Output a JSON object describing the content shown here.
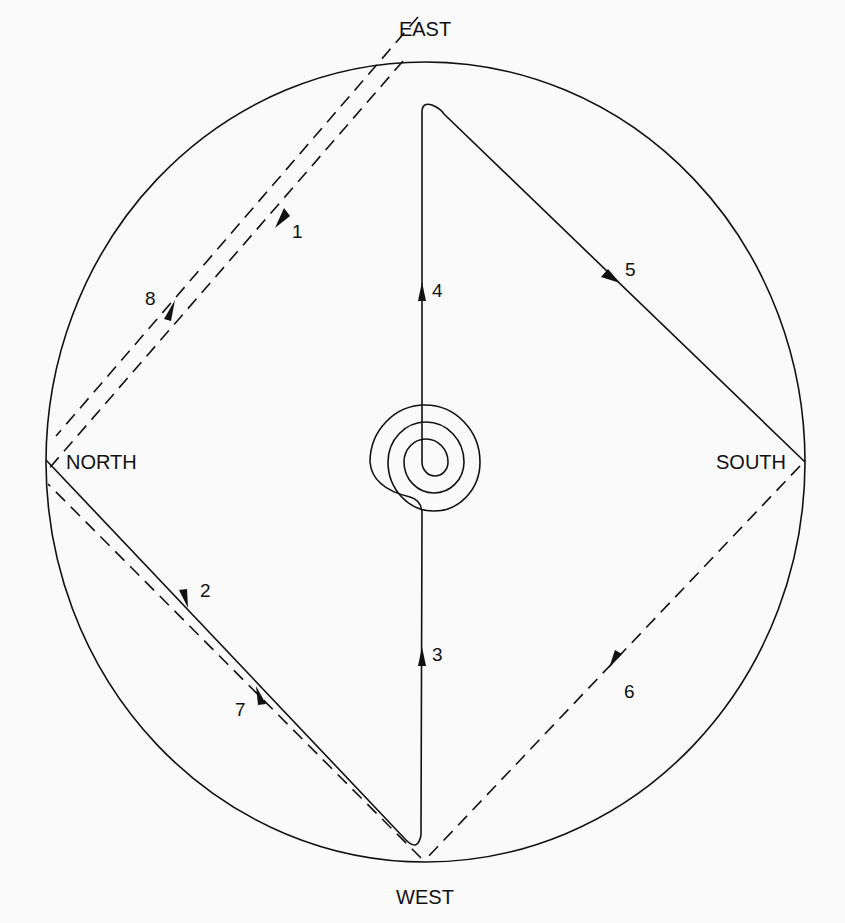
{
  "diagram": {
    "title": "",
    "directions": {
      "east": "EAST",
      "west": "WEST",
      "north": "NORTH",
      "south": "SOUTH"
    },
    "segments": [
      {
        "id": "1",
        "label": "1",
        "style": "dashed",
        "from": "EAST",
        "to": "NORTH"
      },
      {
        "id": "2",
        "label": "2",
        "style": "solid",
        "from": "NORTH",
        "to": "WEST"
      },
      {
        "id": "3",
        "label": "3",
        "style": "solid",
        "from": "WEST",
        "to": "CENTER"
      },
      {
        "id": "4",
        "label": "4",
        "style": "solid",
        "from": "CENTER",
        "to": "EAST"
      },
      {
        "id": "5",
        "label": "5",
        "style": "solid",
        "from": "EAST",
        "to": "SOUTH"
      },
      {
        "id": "6",
        "label": "6",
        "style": "dashed",
        "from": "SOUTH",
        "to": "WEST"
      },
      {
        "id": "7",
        "label": "7",
        "style": "dashed",
        "from": "WEST",
        "to": "NORTH"
      },
      {
        "id": "8",
        "label": "8",
        "style": "dashed",
        "from": "NORTH",
        "to": "EAST"
      }
    ],
    "center_feature": "spiral",
    "colors": {
      "ink": "#111111",
      "paper": "#fafafa"
    }
  }
}
